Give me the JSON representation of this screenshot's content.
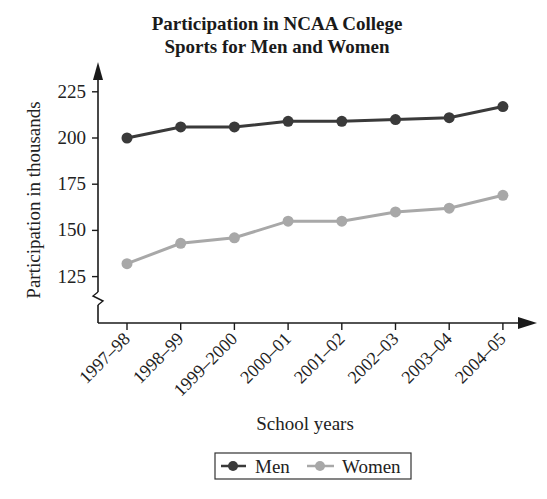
{
  "chart_data": {
    "type": "line",
    "title": "Participation in NCAA College Sports for Men and Women",
    "title_lines": [
      "Participation in NCAA College",
      "Sports for Men and Women"
    ],
    "xlabel": "School years",
    "ylabel": "Participation in thousands",
    "categories": [
      "1997–98",
      "1998–99",
      "1999–2000",
      "2000–01",
      "2001–02",
      "2002–03",
      "2003–04",
      "2004–05"
    ],
    "series": [
      {
        "name": "Men",
        "color": "#3a3a3a",
        "values": [
          200,
          206,
          206,
          209,
          209,
          210,
          211,
          217
        ]
      },
      {
        "name": "Women",
        "color": "#a8a8a8",
        "values": [
          132,
          143,
          146,
          155,
          155,
          160,
          162,
          169
        ]
      }
    ],
    "yticks": [
      125,
      150,
      175,
      200,
      225
    ],
    "ylim": [
      100,
      235
    ],
    "y_axis_break": true,
    "grid": false,
    "legend_position": "bottom-center"
  },
  "legend": {
    "items": [
      {
        "label": "Men",
        "color": "#3a3a3a"
      },
      {
        "label": "Women",
        "color": "#a8a8a8"
      }
    ]
  }
}
